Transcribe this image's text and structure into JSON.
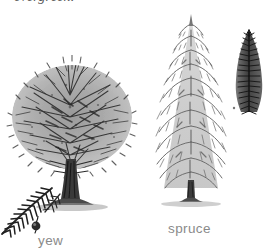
{
  "image": {
    "kind": "botanical-engraving-plate",
    "background_color": "#ffffff",
    "width": 270,
    "height": 251
  },
  "caption": {
    "text": "evergreen.",
    "style": "italic-serif",
    "color": "#585858",
    "clipped_at_top": true
  },
  "labels": {
    "yew": "yew",
    "spruce": "spruce",
    "color": "#8a8a8a"
  },
  "figures": [
    {
      "id": "yew-tree",
      "name": "yew-tree-illustration",
      "label": "yew",
      "description": "broad dense rounded canopy with thick short trunk",
      "ink_color": "#3a3a3a"
    },
    {
      "id": "spruce-tree",
      "name": "spruce-tree-illustration",
      "label": "spruce",
      "description": "tall narrow conical tree with tiered drooping branches",
      "ink_color": "#6b6b6b"
    },
    {
      "id": "yew-sprig",
      "name": "yew-sprig-detail",
      "label": "yew",
      "description": "feathered needle spray with single berry aril",
      "ink_color": "#2e2e2e"
    },
    {
      "id": "spruce-sprig",
      "name": "spruce-sprig-detail",
      "label": "spruce",
      "description": "dark upright needled branch tip",
      "ink_color": "#3f3f3f"
    }
  ]
}
